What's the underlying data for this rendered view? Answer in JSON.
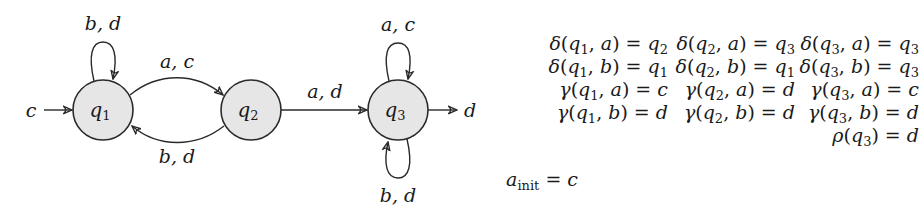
{
  "automaton": {
    "states": [
      {
        "id": "q1",
        "name": "q",
        "sub": "1"
      },
      {
        "id": "q2",
        "name": "q",
        "sub": "2"
      },
      {
        "id": "q3",
        "name": "q",
        "sub": "3"
      }
    ],
    "initial": {
      "state": "q1",
      "label": "c"
    },
    "final": {
      "state": "q3",
      "label": "d"
    },
    "transitions": [
      {
        "from": "q1",
        "to": "q1",
        "label": "b, d"
      },
      {
        "from": "q1",
        "to": "q2",
        "label": "a, c"
      },
      {
        "from": "q2",
        "to": "q1",
        "label": "b, d"
      },
      {
        "from": "q2",
        "to": "q3",
        "label": "a, d"
      },
      {
        "from": "q3",
        "to": "q3",
        "label": "a, c"
      },
      {
        "from": "q3",
        "to": "q3",
        "label": "b, d"
      }
    ]
  },
  "equations": {
    "delta_rows": [
      [
        {
          "fn": "δ",
          "state": "1",
          "sym": "a",
          "rhs": "q",
          "rhs_sub": "2"
        },
        {
          "fn": "δ",
          "state": "2",
          "sym": "a",
          "rhs": "q",
          "rhs_sub": "3"
        },
        {
          "fn": "δ",
          "state": "3",
          "sym": "a",
          "rhs": "q",
          "rhs_sub": "3"
        }
      ],
      [
        {
          "fn": "δ",
          "state": "1",
          "sym": "b",
          "rhs": "q",
          "rhs_sub": "1"
        },
        {
          "fn": "δ",
          "state": "2",
          "sym": "b",
          "rhs": "q",
          "rhs_sub": "1"
        },
        {
          "fn": "δ",
          "state": "3",
          "sym": "b",
          "rhs": "q",
          "rhs_sub": "3"
        }
      ]
    ],
    "gamma_rows": [
      [
        {
          "fn": "γ",
          "state": "1",
          "sym": "a",
          "rhs": "c"
        },
        {
          "fn": "γ",
          "state": "2",
          "sym": "a",
          "rhs": "d"
        },
        {
          "fn": "γ",
          "state": "3",
          "sym": "a",
          "rhs": "c"
        }
      ],
      [
        {
          "fn": "γ",
          "state": "1",
          "sym": "b",
          "rhs": "d"
        },
        {
          "fn": "γ",
          "state": "2",
          "sym": "b",
          "rhs": "d"
        },
        {
          "fn": "γ",
          "state": "3",
          "sym": "b",
          "rhs": "d"
        }
      ]
    ],
    "rho": {
      "fn": "ρ",
      "state": "3",
      "rhs": "d"
    },
    "a_init": {
      "lhs": "a",
      "lhs_sub": "init",
      "rhs": "c"
    }
  },
  "colors": {
    "state_fill": "#e6e6e6",
    "stroke": "#2a2a2a"
  }
}
